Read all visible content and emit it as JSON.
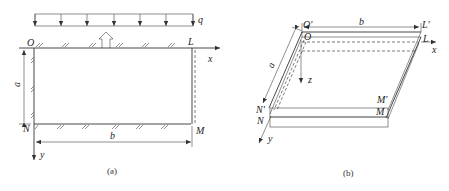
{
  "figure_a": {
    "load_label": "q",
    "origin_label": "O",
    "corner_L_label": "L",
    "corner_N_label": "N",
    "corner_M_label": "M",
    "x_axis_label": "x",
    "y_axis_label": "y",
    "dim_a_label": "a",
    "dim_b_label": "b",
    "caption": "(a)"
  },
  "figure_b": {
    "O_prime_label": "O'",
    "O_label": "O",
    "L_prime_label": "L'",
    "L_label": "L",
    "N_prime_label": "N'",
    "N_label": "N",
    "M_prime_label": "M'",
    "M_label": "M",
    "x_axis_label": "x",
    "y_axis_label": "y",
    "z_axis_label": "z",
    "dim_a_label": "a",
    "dim_b_label": "b",
    "caption": "(b)"
  }
}
